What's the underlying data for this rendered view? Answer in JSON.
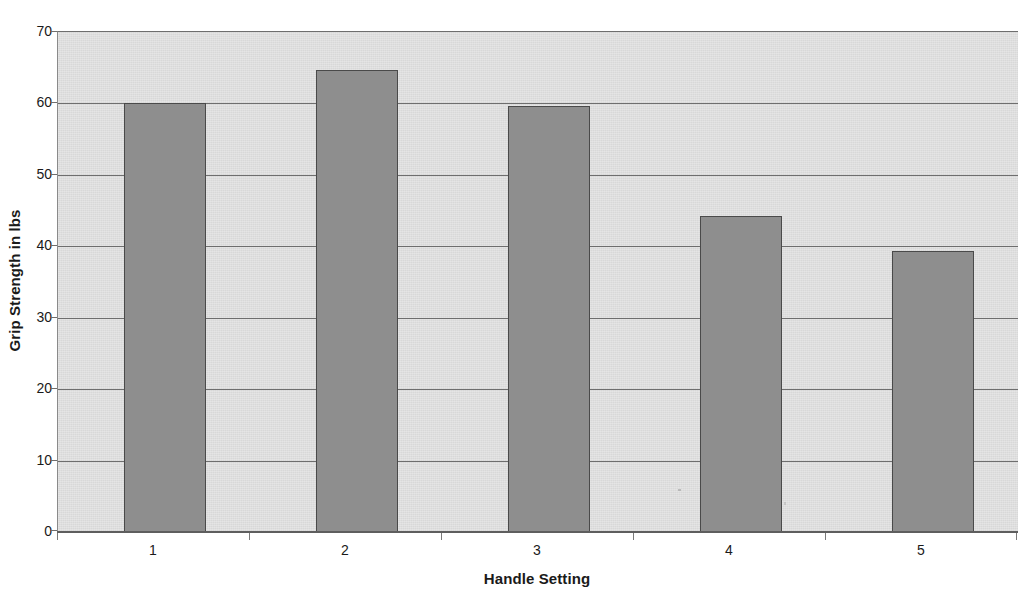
{
  "chart_data": {
    "type": "bar",
    "title": "",
    "subtitle": "",
    "xlabel": "Handle Setting",
    "ylabel": "Grip Strength in lbs",
    "categories": [
      "1",
      "2",
      "3",
      "4",
      "5"
    ],
    "values": [
      60.0,
      64.7,
      59.6,
      44.3,
      39.4
    ],
    "series": [
      {
        "name": "Grip Strength",
        "values": [
          60.0,
          64.7,
          59.6,
          44.3,
          39.4
        ]
      }
    ],
    "ylim": [
      0,
      70
    ],
    "ytick_labels": [
      "0",
      "10",
      "20",
      "30",
      "40",
      "50",
      "60",
      "70"
    ],
    "ytick_values": [
      0,
      10,
      20,
      30,
      40,
      50,
      60,
      70
    ],
    "xtick_labels": [
      "1",
      "2",
      "3",
      "4",
      "5"
    ],
    "grid": true,
    "grid_axis": "y",
    "legend": false,
    "legend_position": "none",
    "bar_color": "#8e8e8e",
    "bar_border_color": "#4a4a4a",
    "plot_background_color": "#d8d8d8",
    "gridline_color": "#6e6e6e",
    "text_color": "#1a1a1a",
    "annotations": []
  },
  "axes": {
    "y_title": "Grip Strength in lbs",
    "x_title": "Handle Setting"
  }
}
